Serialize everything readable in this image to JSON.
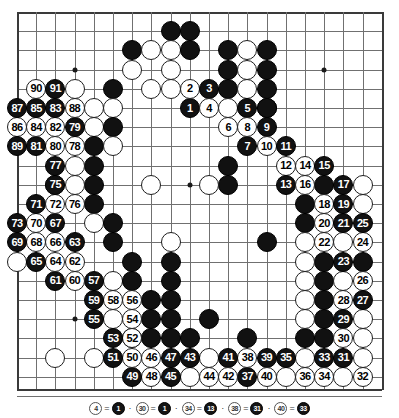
{
  "diagram": {
    "kind": "go-game-record",
    "board_size": 19,
    "visible_columns": 20,
    "visible_rows": 21,
    "geometry": {
      "origin_x": 17,
      "origin_y": 12,
      "spacing": 19.2,
      "stone_diameter": 20
    },
    "colors": {
      "background": "#ffffff",
      "grid_line": "#707070",
      "board_edge": "#3a3a3a",
      "black_stone": "#111111",
      "white_stone": "#ffffff",
      "black_label": "#ffffff",
      "white_label": "#000000"
    },
    "hoshi_points": [
      {
        "col": 16,
        "row": 3
      },
      {
        "col": 3,
        "row": 16
      },
      {
        "col": 16,
        "row": 16
      },
      {
        "col": 9,
        "row": 9
      },
      {
        "col": 3,
        "row": 3
      }
    ]
  },
  "numbered_moves": [
    {
      "n": 1,
      "color": "black",
      "col": 9,
      "row": 5
    },
    {
      "n": 2,
      "color": "white",
      "col": 9,
      "row": 4
    },
    {
      "n": 3,
      "color": "black",
      "col": 10,
      "row": 4
    },
    {
      "n": 4,
      "color": "white",
      "col": 10,
      "row": 5
    },
    {
      "n": 5,
      "color": "black",
      "col": 12,
      "row": 5
    },
    {
      "n": 6,
      "color": "white",
      "col": 11,
      "row": 6
    },
    {
      "n": 7,
      "color": "black",
      "col": 12,
      "row": 7
    },
    {
      "n": 8,
      "color": "white",
      "col": 12,
      "row": 6
    },
    {
      "n": 9,
      "color": "black",
      "col": 13,
      "row": 6
    },
    {
      "n": 10,
      "color": "white",
      "col": 13,
      "row": 7
    },
    {
      "n": 11,
      "color": "black",
      "col": 14,
      "row": 7
    },
    {
      "n": 12,
      "color": "white",
      "col": 14,
      "row": 8
    },
    {
      "n": 13,
      "color": "black",
      "col": 14,
      "row": 9
    },
    {
      "n": 14,
      "color": "white",
      "col": 15,
      "row": 8
    },
    {
      "n": 15,
      "color": "black",
      "col": 16,
      "row": 8
    },
    {
      "n": 16,
      "color": "white",
      "col": 15,
      "row": 9
    },
    {
      "n": 17,
      "color": "black",
      "col": 17,
      "row": 9
    },
    {
      "n": 18,
      "color": "white",
      "col": 16,
      "row": 10
    },
    {
      "n": 19,
      "color": "black",
      "col": 17,
      "row": 10
    },
    {
      "n": 20,
      "color": "white",
      "col": 16,
      "row": 11
    },
    {
      "n": 21,
      "color": "black",
      "col": 17,
      "row": 11
    },
    {
      "n": 22,
      "color": "white",
      "col": 16,
      "row": 12
    },
    {
      "n": 23,
      "color": "black",
      "col": 17,
      "row": 13
    },
    {
      "n": 24,
      "color": "white",
      "col": 18,
      "row": 12
    },
    {
      "n": 25,
      "color": "black",
      "col": 18,
      "row": 11
    },
    {
      "n": 26,
      "color": "white",
      "col": 18,
      "row": 14
    },
    {
      "n": 27,
      "color": "black",
      "col": 18,
      "row": 15
    },
    {
      "n": 28,
      "color": "white",
      "col": 17,
      "row": 15
    },
    {
      "n": 29,
      "color": "black",
      "col": 17,
      "row": 16
    },
    {
      "n": 30,
      "color": "white",
      "col": 17,
      "row": 17
    },
    {
      "n": 31,
      "color": "black",
      "col": 17,
      "row": 18
    },
    {
      "n": 32,
      "color": "white",
      "col": 18,
      "row": 19
    },
    {
      "n": 33,
      "color": "black",
      "col": 16,
      "row": 18
    },
    {
      "n": 34,
      "color": "white",
      "col": 16,
      "row": 19
    },
    {
      "n": 35,
      "color": "black",
      "col": 14,
      "row": 18
    },
    {
      "n": 36,
      "color": "white",
      "col": 15,
      "row": 19
    },
    {
      "n": 37,
      "color": "black",
      "col": 12,
      "row": 19
    },
    {
      "n": 38,
      "color": "white",
      "col": 12,
      "row": 18
    },
    {
      "n": 39,
      "color": "black",
      "col": 13,
      "row": 18
    },
    {
      "n": 40,
      "color": "white",
      "col": 13,
      "row": 19
    },
    {
      "n": 41,
      "color": "black",
      "col": 11,
      "row": 18
    },
    {
      "n": 42,
      "color": "white",
      "col": 11,
      "row": 19
    },
    {
      "n": 43,
      "color": "black",
      "col": 9,
      "row": 18
    },
    {
      "n": 44,
      "color": "white",
      "col": 10,
      "row": 19
    },
    {
      "n": 45,
      "color": "black",
      "col": 8,
      "row": 19
    },
    {
      "n": 46,
      "color": "white",
      "col": 7,
      "row": 18
    },
    {
      "n": 47,
      "color": "black",
      "col": 8,
      "row": 18
    },
    {
      "n": 48,
      "color": "white",
      "col": 7,
      "row": 19
    },
    {
      "n": 49,
      "color": "black",
      "col": 6,
      "row": 19
    },
    {
      "n": 50,
      "color": "white",
      "col": 6,
      "row": 18
    },
    {
      "n": 51,
      "color": "black",
      "col": 5,
      "row": 18
    },
    {
      "n": 52,
      "color": "white",
      "col": 6,
      "row": 17
    },
    {
      "n": 53,
      "color": "black",
      "col": 5,
      "row": 17
    },
    {
      "n": 54,
      "color": "white",
      "col": 6,
      "row": 16
    },
    {
      "n": 55,
      "color": "black",
      "col": 4,
      "row": 16
    },
    {
      "n": 56,
      "color": "white",
      "col": 6,
      "row": 15
    },
    {
      "n": 57,
      "color": "black",
      "col": 4,
      "row": 14
    },
    {
      "n": 58,
      "color": "white",
      "col": 5,
      "row": 15
    },
    {
      "n": 59,
      "color": "black",
      "col": 4,
      "row": 15
    },
    {
      "n": 60,
      "color": "white",
      "col": 3,
      "row": 14
    },
    {
      "n": 61,
      "color": "black",
      "col": 2,
      "row": 14
    },
    {
      "n": 62,
      "color": "white",
      "col": 3,
      "row": 13
    },
    {
      "n": 63,
      "color": "black",
      "col": 3,
      "row": 12
    },
    {
      "n": 64,
      "color": "white",
      "col": 2,
      "row": 13
    },
    {
      "n": 65,
      "color": "black",
      "col": 1,
      "row": 13
    },
    {
      "n": 66,
      "color": "white",
      "col": 2,
      "row": 12
    },
    {
      "n": 67,
      "color": "black",
      "col": 2,
      "row": 11
    },
    {
      "n": 68,
      "color": "white",
      "col": 1,
      "row": 12
    },
    {
      "n": 69,
      "color": "black",
      "col": 0,
      "row": 12
    },
    {
      "n": 70,
      "color": "white",
      "col": 1,
      "row": 11
    },
    {
      "n": 71,
      "color": "black",
      "col": 1,
      "row": 10
    },
    {
      "n": 72,
      "color": "white",
      "col": 2,
      "row": 10
    },
    {
      "n": 73,
      "color": "black",
      "col": 0,
      "row": 11
    },
    {
      "n": 74,
      "color": "white",
      "col": 2,
      "row": 9
    },
    {
      "n": 75,
      "color": "black",
      "col": 2,
      "row": 9
    },
    {
      "n": 76,
      "color": "white",
      "col": 3,
      "row": 10
    },
    {
      "n": 77,
      "color": "black",
      "col": 2,
      "row": 8
    },
    {
      "n": 78,
      "color": "white",
      "col": 3,
      "row": 7
    },
    {
      "n": 79,
      "color": "black",
      "col": 3,
      "row": 6
    },
    {
      "n": 80,
      "color": "white",
      "col": 2,
      "row": 7
    },
    {
      "n": 81,
      "color": "black",
      "col": 1,
      "row": 7
    },
    {
      "n": 82,
      "color": "white",
      "col": 2,
      "row": 6
    },
    {
      "n": 83,
      "color": "black",
      "col": 2,
      "row": 5
    },
    {
      "n": 84,
      "color": "white",
      "col": 1,
      "row": 6
    },
    {
      "n": 85,
      "color": "black",
      "col": 1,
      "row": 5
    },
    {
      "n": 86,
      "color": "white",
      "col": 0,
      "row": 6
    },
    {
      "n": 87,
      "color": "black",
      "col": 0,
      "row": 5
    },
    {
      "n": 88,
      "color": "white",
      "col": 3,
      "row": 5
    },
    {
      "n": 89,
      "color": "black",
      "col": 0,
      "row": 7
    },
    {
      "n": 90,
      "color": "white",
      "col": 1,
      "row": 4
    },
    {
      "n": 91,
      "color": "black",
      "col": 2,
      "row": 4
    }
  ],
  "plain_stones": [
    {
      "color": "black",
      "col": 8,
      "row": 1
    },
    {
      "color": "black",
      "col": 9,
      "row": 1
    },
    {
      "color": "black",
      "col": 6,
      "row": 2
    },
    {
      "color": "white",
      "col": 7,
      "row": 2
    },
    {
      "color": "white",
      "col": 8,
      "row": 2
    },
    {
      "color": "black",
      "col": 9,
      "row": 2
    },
    {
      "color": "black",
      "col": 11,
      "row": 2
    },
    {
      "color": "white",
      "col": 12,
      "row": 2
    },
    {
      "color": "black",
      "col": 13,
      "row": 2
    },
    {
      "color": "white",
      "col": 6,
      "row": 3
    },
    {
      "color": "white",
      "col": 8,
      "row": 3
    },
    {
      "color": "black",
      "col": 11,
      "row": 3
    },
    {
      "color": "white",
      "col": 12,
      "row": 3
    },
    {
      "color": "black",
      "col": 13,
      "row": 3
    },
    {
      "color": "white",
      "col": 3,
      "row": 4
    },
    {
      "color": "black",
      "col": 5,
      "row": 4
    },
    {
      "color": "white",
      "col": 7,
      "row": 4
    },
    {
      "color": "white",
      "col": 8,
      "row": 4
    },
    {
      "color": "black",
      "col": 11,
      "row": 4
    },
    {
      "color": "white",
      "col": 12,
      "row": 4
    },
    {
      "color": "black",
      "col": 13,
      "row": 4
    },
    {
      "color": "white",
      "col": 4,
      "row": 5
    },
    {
      "color": "white",
      "col": 5,
      "row": 5
    },
    {
      "color": "white",
      "col": 11,
      "row": 5
    },
    {
      "color": "black",
      "col": 13,
      "row": 5
    },
    {
      "color": "white",
      "col": 4,
      "row": 6
    },
    {
      "color": "black",
      "col": 5,
      "row": 6
    },
    {
      "color": "black",
      "col": 13,
      "row": 5
    },
    {
      "color": "black",
      "col": 4,
      "row": 7
    },
    {
      "color": "white",
      "col": 5,
      "row": 7
    },
    {
      "color": "black",
      "col": 4,
      "row": 8
    },
    {
      "color": "white",
      "col": 3,
      "row": 8
    },
    {
      "color": "black",
      "col": 11,
      "row": 8
    },
    {
      "color": "black",
      "col": 15,
      "row": 10
    },
    {
      "color": "black",
      "col": 4,
      "row": 9
    },
    {
      "color": "white",
      "col": 3,
      "row": 9
    },
    {
      "color": "black",
      "col": 11,
      "row": 9
    },
    {
      "color": "white",
      "col": 7,
      "row": 9
    },
    {
      "color": "white",
      "col": 10,
      "row": 9
    },
    {
      "color": "black",
      "col": 4,
      "row": 10
    },
    {
      "color": "black",
      "col": 15,
      "row": 11
    },
    {
      "color": "white",
      "col": 4,
      "row": 11
    },
    {
      "color": "black",
      "col": 5,
      "row": 11
    },
    {
      "color": "black",
      "col": 16,
      "row": 13
    },
    {
      "color": "white",
      "col": 8,
      "row": 12
    },
    {
      "color": "black",
      "col": 5,
      "row": 12
    },
    {
      "color": "black",
      "col": 16,
      "row": 14
    },
    {
      "color": "white",
      "col": 17,
      "row": 14
    },
    {
      "color": "black",
      "col": 13,
      "row": 12
    },
    {
      "color": "black",
      "col": 6,
      "row": 13
    },
    {
      "color": "black",
      "col": 16,
      "row": 15
    },
    {
      "color": "white",
      "col": 5,
      "row": 14
    },
    {
      "color": "black",
      "col": 6,
      "row": 14
    },
    {
      "color": "black",
      "col": 8,
      "row": 13
    },
    {
      "color": "black",
      "col": 7,
      "row": 15
    },
    {
      "color": "black",
      "col": 8,
      "row": 14
    },
    {
      "color": "black",
      "col": 16,
      "row": 16
    },
    {
      "color": "white",
      "col": 5,
      "row": 16
    },
    {
      "color": "black",
      "col": 7,
      "row": 16
    },
    {
      "color": "black",
      "col": 8,
      "row": 15
    },
    {
      "color": "black",
      "col": 7,
      "row": 17
    },
    {
      "color": "black",
      "col": 8,
      "row": 16
    },
    {
      "color": "black",
      "col": 15,
      "row": 17
    },
    {
      "color": "black",
      "col": 16,
      "row": 17
    },
    {
      "color": "black",
      "col": 6,
      "row": 17
    },
    {
      "color": "black",
      "col": 8,
      "row": 17
    },
    {
      "color": "black",
      "col": 9,
      "row": 17
    },
    {
      "color": "black",
      "col": 12,
      "row": 17
    },
    {
      "color": "white",
      "col": 2,
      "row": 18
    },
    {
      "color": "white",
      "col": 4,
      "row": 18
    },
    {
      "color": "white",
      "col": 10,
      "row": 18
    },
    {
      "color": "white",
      "col": 15,
      "row": 18
    },
    {
      "color": "white",
      "col": 18,
      "row": 18
    },
    {
      "color": "white",
      "col": 9,
      "row": 19
    },
    {
      "color": "white",
      "col": 14,
      "row": 19
    },
    {
      "color": "white",
      "col": 17,
      "row": 19
    },
    {
      "color": "white",
      "col": 0,
      "row": 13
    },
    {
      "color": "black",
      "col": 10,
      "row": 16
    },
    {
      "color": "black",
      "col": 18,
      "row": 13
    },
    {
      "color": "white",
      "col": 18,
      "row": 16
    },
    {
      "color": "white",
      "col": 18,
      "row": 17
    },
    {
      "color": "white",
      "col": 17,
      "row": 12
    },
    {
      "color": "white",
      "col": 15,
      "row": 12
    },
    {
      "color": "white",
      "col": 15,
      "row": 13
    },
    {
      "color": "white",
      "col": 15,
      "row": 14
    },
    {
      "color": "white",
      "col": 15,
      "row": 15
    },
    {
      "color": "white",
      "col": 15,
      "row": 16
    },
    {
      "color": "black",
      "col": 16,
      "row": 9
    },
    {
      "color": "white",
      "col": 18,
      "row": 9
    },
    {
      "color": "white",
      "col": 18,
      "row": 10
    }
  ],
  "caption": {
    "separator": "·",
    "equals": "=",
    "entries": [
      {
        "from": "4",
        "from_color": "white",
        "to": "1",
        "to_color": "black"
      },
      {
        "from": "30",
        "from_color": "white",
        "to": "1",
        "to_color": "black"
      },
      {
        "from": "34",
        "from_color": "white",
        "to": "13",
        "to_color": "black"
      },
      {
        "from": "38",
        "from_color": "white",
        "to": "31",
        "to_color": "black"
      },
      {
        "from": "40",
        "from_color": "white",
        "to": "33",
        "to_color": "black"
      }
    ]
  }
}
